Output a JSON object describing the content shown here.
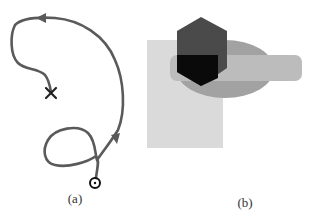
{
  "figure": {
    "panels": [
      {
        "id": "a",
        "caption": "(a)",
        "description": "Curved trajectory path with direction arrows, start circle and end cross",
        "path_color": "#555555",
        "markers": {
          "start": "circle",
          "end": "cross"
        }
      },
      {
        "id": "b",
        "caption": "(b)",
        "description": "Overlapping shapes: rectangle, hexagon, ellipse and rounded bar",
        "shapes": [
          {
            "name": "light-rectangle",
            "color": "#d9d9d9"
          },
          {
            "name": "ellipse",
            "color": "#a3a3a3"
          },
          {
            "name": "rounded-bar",
            "color": "#bdbdbd"
          },
          {
            "name": "hexagon",
            "color": "#4a4a4a"
          },
          {
            "name": "hexagon-overlap",
            "color": "#0a0a0a"
          }
        ]
      }
    ]
  }
}
